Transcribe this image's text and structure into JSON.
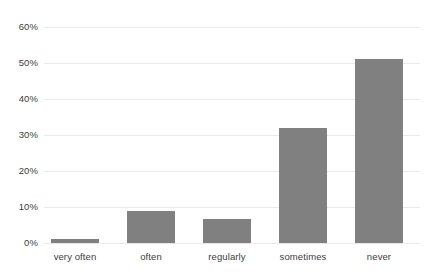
{
  "chart_data": {
    "type": "bar",
    "title": "",
    "subtitle": "",
    "xlabel": "",
    "ylabel": "",
    "categories": [
      "very often",
      "often",
      "regularly",
      "sometimes",
      "never"
    ],
    "values": [
      1,
      9,
      6.7,
      32,
      51
    ],
    "value_labels": [
      "1%",
      "9%",
      "6.7%",
      "32%",
      "51%"
    ],
    "series": [
      {
        "name": "frequency",
        "values": [
          1,
          9,
          6.7,
          32,
          51
        ]
      }
    ],
    "ylim": [
      0,
      60
    ],
    "ytick_values": [
      0,
      10,
      20,
      30,
      40,
      50,
      60
    ],
    "ytick_labels": [
      "0%",
      "10%",
      "20%",
      "30%",
      "40%",
      "50%",
      "60%"
    ],
    "grid": true,
    "grid_axis": "y",
    "legend": false,
    "legend_position": "none",
    "bar_color": "#808080",
    "grid_color": "#e9e9e9",
    "text_color": "#3c3c3c",
    "background_color": "#ffffff"
  }
}
